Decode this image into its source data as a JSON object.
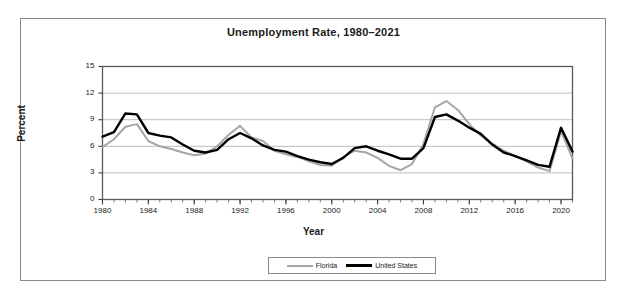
{
  "chart_data": {
    "type": "line",
    "title": "Unemployment Rate, 1980–2021",
    "xlabel": "Year",
    "ylabel": "Percent",
    "xlim": [
      1980,
      2021
    ],
    "ylim": [
      0,
      15
    ],
    "ytick_labels": [
      "0",
      "3",
      "6",
      "9",
      "12",
      "15"
    ],
    "yticks": [
      0,
      3,
      6,
      9,
      12,
      15
    ],
    "xtick_labels": [
      "1980",
      "1984",
      "1988",
      "1992",
      "1996",
      "2000",
      "2004",
      "2008",
      "2012",
      "2016",
      "2020"
    ],
    "xticks": [
      1980,
      1984,
      1988,
      1992,
      1996,
      2000,
      2004,
      2008,
      2012,
      2016,
      2020
    ],
    "x_minor_tick_step": 1,
    "grid": "horizontal",
    "legend_position": "bottom-center",
    "x": [
      1980,
      1981,
      1982,
      1983,
      1984,
      1985,
      1986,
      1987,
      1988,
      1989,
      1990,
      1991,
      1992,
      1993,
      1994,
      1995,
      1996,
      1997,
      1998,
      1999,
      2000,
      2001,
      2002,
      2003,
      2004,
      2005,
      2006,
      2007,
      2008,
      2009,
      2010,
      2011,
      2012,
      2013,
      2014,
      2015,
      2016,
      2017,
      2018,
      2019,
      2020,
      2021
    ],
    "series": [
      {
        "name": "Florida",
        "color": "#a6a6a6",
        "values": [
          5.9,
          6.8,
          8.2,
          8.5,
          6.6,
          6.0,
          5.7,
          5.3,
          5.0,
          5.2,
          6.0,
          7.3,
          8.3,
          7.0,
          6.6,
          5.5,
          5.1,
          4.8,
          4.3,
          3.9,
          3.8,
          4.8,
          5.5,
          5.3,
          4.7,
          3.8,
          3.3,
          4.0,
          6.3,
          10.4,
          11.1,
          10.1,
          8.5,
          7.2,
          6.3,
          5.5,
          4.9,
          4.3,
          3.6,
          3.2,
          7.7,
          4.6
        ]
      },
      {
        "name": "United States",
        "color": "#000000",
        "values": [
          7.1,
          7.6,
          9.7,
          9.6,
          7.5,
          7.2,
          7.0,
          6.2,
          5.5,
          5.3,
          5.6,
          6.8,
          7.5,
          6.9,
          6.1,
          5.6,
          5.4,
          4.9,
          4.5,
          4.2,
          4.0,
          4.7,
          5.8,
          6.0,
          5.5,
          5.1,
          4.6,
          4.6,
          5.8,
          9.3,
          9.6,
          8.9,
          8.1,
          7.4,
          6.2,
          5.3,
          4.9,
          4.4,
          3.9,
          3.7,
          8.1,
          5.4
        ]
      }
    ]
  },
  "legend": {
    "entries": [
      {
        "label": "Florida"
      },
      {
        "label": "United States"
      }
    ]
  }
}
